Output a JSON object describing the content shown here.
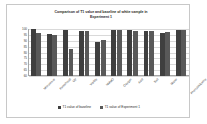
{
  "chart_data": {
    "type": "bar",
    "title": "Comparison of T1 value and baseline of white sample in Experiment 1",
    "title_line1": "Comparison of T1 value and baseline of white sample in",
    "title_line2": "Experiment 1",
    "xlabel": "",
    "ylabel": "",
    "ylim": [
      60,
      100
    ],
    "grid": true,
    "legend_position": "bottom",
    "yticks": [
      100,
      95,
      90,
      85,
      80,
      75,
      70,
      65,
      60
    ],
    "categories": [
      "Microwave",
      "Fumehood",
      "UV",
      "Visible",
      "NMMO",
      "Oxygen",
      "Acid",
      "Salt",
      "Water",
      "Phenol/Alkaline"
    ],
    "series": [
      {
        "name": "T1 value of baseline",
        "color": "#3f3f3f",
        "values": [
          99.8,
          95.5,
          99.5,
          98.5,
          89.0,
          99.5,
          98.8,
          98.5,
          96.5,
          99.5
        ]
      },
      {
        "name": "T1 value of Experiment 1",
        "color": "#595959",
        "values": [
          96.5,
          95.0,
          83.0,
          98.0,
          91.0,
          99.0,
          98.0,
          98.0,
          97.5,
          99.0
        ]
      }
    ]
  },
  "legend": {
    "items": [
      {
        "label": "T1 value of baseline",
        "color": "#3f3f3f"
      },
      {
        "label": "T1 value of Experiment 1",
        "color": "#595959"
      }
    ]
  }
}
